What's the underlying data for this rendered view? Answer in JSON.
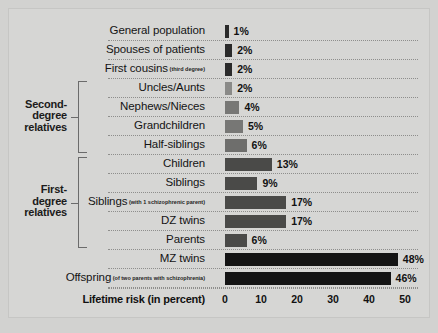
{
  "chart_data": {
    "type": "bar",
    "orientation": "horizontal",
    "title": "",
    "xlabel": "Lifetime risk (in percent)",
    "ylabel": "",
    "xlim": [
      0,
      50
    ],
    "xticks": [
      0,
      10,
      20,
      30,
      40,
      50
    ],
    "grid": true,
    "legend": null,
    "value_suffix": "%",
    "categories": [
      "General population",
      "Spouses of patients",
      "First cousins",
      "Uncles/Aunts",
      "Nephews/Nieces",
      "Grandchildren",
      "Half-siblings",
      "Children",
      "Siblings",
      "Siblings",
      "DZ twins",
      "Parents",
      "MZ twins",
      "Offspring"
    ],
    "values": [
      1,
      2,
      2,
      2,
      4,
      5,
      6,
      13,
      9,
      17,
      17,
      6,
      48,
      46
    ],
    "bars": [
      {
        "label": "General population",
        "sub": "",
        "value": 1,
        "value_text": "1%",
        "color": "#2a2a2a",
        "group": ""
      },
      {
        "label": "Spouses of patients",
        "sub": "",
        "value": 2,
        "value_text": "2%",
        "color": "#2a2a2a",
        "group": ""
      },
      {
        "label": "First cousins",
        "sub": "(third degree)",
        "value": 2,
        "value_text": "2%",
        "color": "#2a2a2a",
        "group": ""
      },
      {
        "label": "Uncles/Aunts",
        "sub": "",
        "value": 2,
        "value_text": "2%",
        "color": "#8a8a88",
        "group": "second-degree"
      },
      {
        "label": "Nephews/Nieces",
        "sub": "",
        "value": 4,
        "value_text": "4%",
        "color": "#777775",
        "group": "second-degree"
      },
      {
        "label": "Grandchildren",
        "sub": "",
        "value": 5,
        "value_text": "5%",
        "color": "#777775",
        "group": "second-degree"
      },
      {
        "label": "Half-siblings",
        "sub": "",
        "value": 6,
        "value_text": "6%",
        "color": "#6e6e6c",
        "group": "second-degree"
      },
      {
        "label": "Children",
        "sub": "",
        "value": 13,
        "value_text": "13%",
        "color": "#4a4a48",
        "group": "first-degree"
      },
      {
        "label": "Siblings",
        "sub": "",
        "value": 9,
        "value_text": "9%",
        "color": "#4a4a48",
        "group": "first-degree"
      },
      {
        "label": "Siblings",
        "sub": "(with 1 schizophrenic parent)",
        "value": 17,
        "value_text": "17%",
        "color": "#4a4a48",
        "group": "first-degree"
      },
      {
        "label": "DZ twins",
        "sub": "",
        "value": 17,
        "value_text": "17%",
        "color": "#4a4a48",
        "group": "first-degree"
      },
      {
        "label": "Parents",
        "sub": "",
        "value": 6,
        "value_text": "6%",
        "color": "#4a4a48",
        "group": "first-degree"
      },
      {
        "label": "MZ twins",
        "sub": "",
        "value": 48,
        "value_text": "48%",
        "color": "#141414",
        "group": ""
      },
      {
        "label": "Offspring",
        "sub": "(of two parents with schizophrenia)",
        "value": 46,
        "value_text": "46%",
        "color": "#141414",
        "group": ""
      }
    ],
    "groups": [
      {
        "id": "second-degree",
        "lines": [
          "Second-",
          "degree",
          "relatives"
        ],
        "first_row": 3,
        "last_row": 6
      },
      {
        "id": "first-degree",
        "lines": [
          "First-",
          "degree",
          "relatives"
        ],
        "first_row": 7,
        "last_row": 11
      }
    ]
  }
}
